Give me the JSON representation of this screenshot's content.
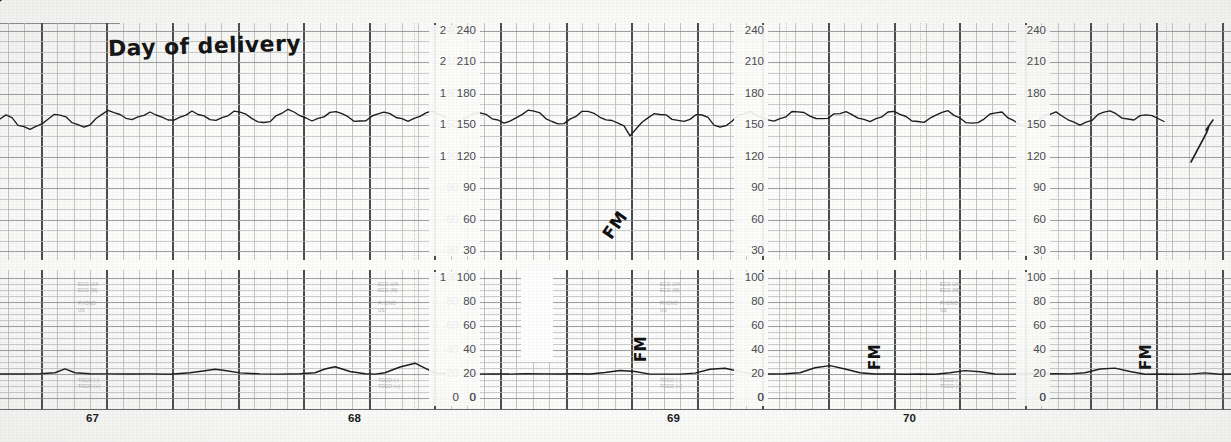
{
  "document": {
    "kind": "cardiotocography-paper-trace",
    "title": "Day of delivery"
  },
  "annotations": {
    "title_note": "Day of delivery",
    "event_marks": [
      {
        "label": "FM",
        "x": 628,
        "y": 340,
        "rotation": -90
      },
      {
        "label": "FM",
        "x": 862,
        "y": 348,
        "rotation": -90
      },
      {
        "label": "FM",
        "x": 1133,
        "y": 348,
        "rotation": -90
      }
    ],
    "scribble": {
      "label": "FM",
      "x": 600,
      "y": 215,
      "rotation": -55
    }
  },
  "fhr_panel": {
    "name": "fetal-heart-rate",
    "unit": "bpm",
    "ticks": [
      240,
      210,
      180,
      150,
      120,
      90,
      60,
      30
    ],
    "ylim": [
      15,
      240
    ],
    "axis_x_positions": [
      455,
      472,
      760,
      1042
    ],
    "channels": [
      "ECG U/A",
      "ECG (M)",
      "PHONO",
      "US"
    ]
  },
  "toco_panel": {
    "name": "uterine-activity-toco",
    "unit": "relative units",
    "ticks": [
      100,
      80,
      60,
      40,
      20,
      0
    ],
    "ylim": [
      0,
      108
    ],
    "channels_upper": [
      "ECG U/A",
      "ECG (M)",
      "PHONO",
      "US"
    ],
    "channels_lower": [
      "TOCO (-)",
      "TOCO (+)"
    ],
    "baseline_value": 20,
    "zero_labels": [
      "0",
      "0",
      "0",
      "0"
    ]
  },
  "time_axis": {
    "name": "elapsed-time-markers",
    "marks": [
      {
        "label": "67",
        "x": 86
      },
      {
        "label": "68",
        "x": 348
      },
      {
        "label": "69",
        "x": 667
      },
      {
        "label": "70",
        "x": 903
      }
    ]
  },
  "colors": {
    "paper": "#fdfdfc",
    "grid_minor": "#b7b9ba",
    "grid_major": "#3c3e40",
    "trace_ink": "#1a1c1d",
    "label_ink": "#4a4c4e",
    "handwriting_ink": "#121212"
  },
  "chart_data": {
    "type": "line",
    "title": "Day of delivery",
    "xlabel": "",
    "ylabel": "FHR (bpm)  /  Uterine activity",
    "grid": true,
    "legend": "none",
    "panels": [
      {
        "name": "fetal heart rate",
        "ylabel": "bpm",
        "ylim": [
          15,
          240
        ],
        "yticks": [
          30,
          60,
          90,
          120,
          150,
          180,
          210,
          240
        ],
        "baseline": 155,
        "variability_bpm": 12,
        "series": [
          {
            "name": "FHR",
            "x": [
              0,
              6,
              12,
              18,
              24,
              30,
              36,
              42,
              48,
              54,
              60,
              66,
              72,
              78,
              84,
              90,
              96,
              102,
              108,
              114,
              120,
              126,
              132,
              138,
              144,
              150,
              156,
              162,
              168,
              174,
              180,
              186,
              192,
              198,
              204,
              210,
              216,
              222,
              228,
              234,
              240,
              246,
              252,
              258,
              264,
              270,
              276,
              282,
              288,
              294,
              300,
              306,
              312,
              318,
              324,
              330,
              336,
              342,
              348,
              354,
              360,
              366,
              372,
              378,
              384,
              390,
              396,
              402,
              408,
              414,
              420,
              426,
              432,
              438,
              444,
              450,
              456,
              462,
              468,
              474,
              480,
              486,
              492,
              498,
              504,
              510,
              516,
              522,
              528,
              534,
              540,
              546,
              552,
              558,
              564,
              570,
              576,
              582,
              588,
              594,
              600,
              606,
              612,
              618,
              624,
              630,
              636,
              642,
              648,
              654,
              660,
              666,
              672,
              678,
              684,
              690,
              696,
              702,
              708,
              714,
              720,
              726,
              732,
              738,
              744,
              750,
              756,
              762,
              768,
              774,
              780,
              786,
              792,
              798,
              804,
              810,
              816,
              822,
              828,
              834,
              840,
              846,
              852,
              858,
              864,
              870,
              876,
              882,
              888,
              894,
              900,
              906,
              912,
              918,
              924,
              930,
              936,
              942,
              948,
              954,
              960,
              966,
              972,
              978,
              984,
              990,
              996,
              1002,
              1008,
              1014,
              1020,
              1026,
              1032,
              1038,
              1044,
              1050,
              1056,
              1062,
              1068,
              1074,
              1080,
              1086,
              1092,
              1098,
              1104,
              1110,
              1116,
              1122,
              1128,
              1134,
              1140,
              1146,
              1152,
              1158,
              1164,
              1170,
              1176,
              1182,
              1188,
              1194,
              1200,
              1206,
              1212,
              1218
            ],
            "values": [
              156,
              160,
              156,
              150,
              147,
              146,
              148,
              151,
              156,
              160,
              161,
              158,
              154,
              151,
              149,
              151,
              156,
              161,
              163,
              162,
              159,
              156,
              155,
              157,
              160,
              162,
              161,
              158,
              156,
              156,
              158,
              161,
              163,
              161,
              158,
              155,
              154,
              156,
              159,
              162,
              163,
              160,
              157,
              154,
              153,
              155,
              159,
              163,
              165,
              163,
              159,
              156,
              154,
              155,
              158,
              161,
              163,
              161,
              158,
              155,
              154,
              156,
              159,
              162,
              163,
              161,
              158,
              155,
              154,
              155,
              158,
              161,
              163,
              161,
              158,
              156,
              155,
              156,
              159,
              162,
              163,
              160,
              157,
              154,
              152,
              153,
              156,
              160,
              163,
              164,
              161,
              157,
              154,
              152,
              153,
              156,
              160,
              163,
              164,
              161,
              157,
              155,
              153,
              152,
              148,
              140,
              146,
              153,
              158,
              161,
              162,
              160,
              157,
              155,
              154,
              156,
              159,
              160,
              156,
              150,
              147,
              149,
              154,
              159,
              162,
              163,
              161,
              158,
              156,
              155,
              156,
              159,
              162,
              163,
              161,
              158,
              156,
              155,
              157,
              160,
              162,
              163,
              161,
              158,
              156,
              155,
              156,
              159,
              162,
              163,
              160,
              157,
              154,
              152,
              153,
              156,
              160,
              163,
              164,
              161,
              157,
              154,
              152,
              153,
              156,
              160,
              162,
              161,
              157,
              153,
              150,
              149,
              151,
              155,
              159,
              162,
              163,
              160,
              156,
              153,
              151,
              152,
              155,
              159,
              162,
              163,
              160,
              157,
              155,
              156,
              159,
              161,
              160,
              157,
              155
            ]
          }
        ]
      },
      {
        "name": "uterine activity (toco)",
        "ylabel": "units",
        "ylim": [
          0,
          108
        ],
        "yticks": [
          0,
          20,
          40,
          60,
          80,
          100
        ],
        "baseline": 20,
        "series": [
          {
            "name": "TOCO",
            "x": [
              0,
              20,
              40,
              55,
              65,
              75,
              90,
              110,
              130,
              150,
              170,
              190,
              205,
              215,
              225,
              240,
              260,
              280,
              300,
              315,
              325,
              335,
              350,
              365,
              375,
              385,
              400,
              415,
              425,
              435,
              450,
              470,
              490,
              510,
              525,
              545,
              560,
              575,
              590,
              605,
              620,
              635,
              650,
              665,
              680,
              695,
              710,
              725,
              740,
              755,
              770,
              785,
              800,
              815,
              830,
              845,
              860,
              875,
              890,
              905,
              920,
              935,
              950,
              965,
              980,
              995,
              1010,
              1025,
              1040,
              1055,
              1070,
              1085,
              1100,
              1115,
              1130,
              1145,
              1160,
              1175,
              1190,
              1205,
              1220,
              1231
            ],
            "values": [
              20,
              20,
              20,
              21,
              24,
              21,
              20,
              20,
              20,
              20,
              20,
              21,
              23,
              24,
              23,
              21,
              20,
              20,
              20,
              21,
              24,
              26,
              22,
              20,
              20,
              21,
              26,
              29,
              25,
              21,
              20,
              20,
              20,
              20,
              20,
              20,
              20,
              20,
              20,
              21,
              23,
              22,
              20,
              20,
              20,
              21,
              24,
              25,
              22,
              20,
              20,
              20,
              21,
              25,
              27,
              24,
              21,
              20,
              20,
              20,
              20,
              20,
              21,
              23,
              22,
              20,
              20,
              20,
              20,
              20,
              20,
              21,
              24,
              25,
              22,
              20,
              20,
              20,
              20,
              21,
              20,
              20
            ]
          }
        ]
      }
    ]
  }
}
